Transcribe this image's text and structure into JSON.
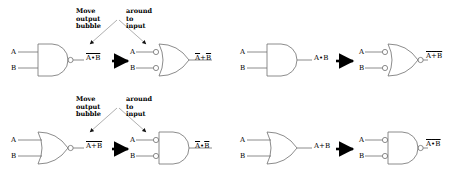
{
  "figure": {
    "colors": {
      "line": "#808080",
      "gate_outline": "#666666",
      "text": "#000000",
      "arrow": "#000000",
      "annotation_line": "#999999"
    }
  },
  "annotation": {
    "left_line1": "Move",
    "left_line2": "output",
    "left_line3": "bubble",
    "right_line1": "around",
    "right_line2": "to",
    "right_line3": "input"
  },
  "panels": [
    {
      "id": "top-left",
      "position": "top-left",
      "has_annotation": true,
      "source_gate": {
        "type": "nand",
        "shape": "and",
        "output_bubble": true,
        "input_bubbles": false,
        "inputs": [
          "A",
          "B"
        ],
        "output_label": "A•B",
        "output_overbar": true
      },
      "result_gate": {
        "type": "or-with-inverted-inputs",
        "shape": "or",
        "output_bubble": false,
        "input_bubbles": true,
        "inputs": [
          "A",
          "B"
        ],
        "output_label": "A+B",
        "output_label_parts": [
          "A",
          "+",
          "B"
        ],
        "output_overbar_each": true
      },
      "relation": "equals"
    },
    {
      "id": "top-right",
      "position": "top-right",
      "has_annotation": false,
      "source_gate": {
        "type": "and",
        "shape": "and",
        "output_bubble": false,
        "input_bubbles": false,
        "inputs": [
          "A",
          "B"
        ],
        "output_label": "A•B",
        "output_overbar": false
      },
      "result_gate": {
        "type": "nor-with-inverted-inputs",
        "shape": "or",
        "output_bubble": true,
        "input_bubbles": true,
        "inputs": [
          "A",
          "B"
        ],
        "output_label": "A+B",
        "output_label_parts": [
          "A",
          "+",
          "B"
        ],
        "output_overbar_each": true,
        "output_overbar_whole": true
      },
      "relation": "equals"
    },
    {
      "id": "bottom-left",
      "position": "bottom-left",
      "has_annotation": true,
      "source_gate": {
        "type": "nor",
        "shape": "or",
        "output_bubble": true,
        "input_bubbles": false,
        "inputs": [
          "A",
          "B"
        ],
        "output_label": "A+B",
        "output_overbar": true
      },
      "result_gate": {
        "type": "and-with-inverted-inputs",
        "shape": "and",
        "output_bubble": false,
        "input_bubbles": true,
        "inputs": [
          "A",
          "B"
        ],
        "output_label": "A•B",
        "output_label_parts": [
          "A",
          "•",
          "B"
        ],
        "output_overbar_each": true
      },
      "relation": "equals"
    },
    {
      "id": "bottom-right",
      "position": "bottom-right",
      "has_annotation": false,
      "source_gate": {
        "type": "or",
        "shape": "or",
        "output_bubble": false,
        "input_bubbles": false,
        "inputs": [
          "A",
          "B"
        ],
        "output_label": "A+B",
        "output_overbar": false
      },
      "result_gate": {
        "type": "nand-with-inverted-inputs",
        "shape": "and",
        "output_bubble": true,
        "input_bubbles": true,
        "inputs": [
          "A",
          "B"
        ],
        "output_label": "A•B",
        "output_label_parts": [
          "A",
          "•",
          "B"
        ],
        "output_overbar_each": true,
        "output_overbar_whole": true
      },
      "relation": "equals"
    }
  ],
  "signals": {
    "a": "A",
    "b": "B",
    "plus": "+",
    "dot": "•"
  }
}
